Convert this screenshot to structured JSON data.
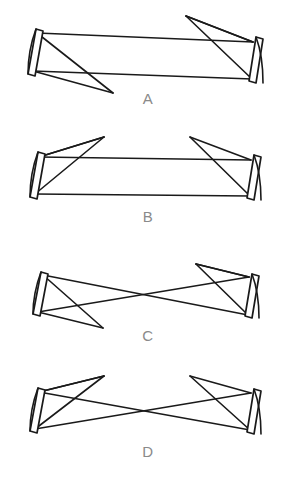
{
  "figure": {
    "background_color": "#ffffff",
    "line_color": "#1a1a1a",
    "label_color": "#8a8a8a",
    "width": 284,
    "height": 486,
    "panel_count": 4
  },
  "panels": [
    {
      "id": "panel-a",
      "label": "A",
      "label_x": 148,
      "label_y": 104,
      "description": "Asymmetric cavity, ray bundle exits low on the left and folds high on the right",
      "left_mirror": {
        "name": "left-mirror",
        "outer": "M 36 29 L 43 31 L 35 76 L 28 74 Z",
        "arc": "M 36 29 C 30 45 28 60 28 74",
        "top_x": 37,
        "top_y": 32,
        "bottom_x": 33,
        "bottom_y": 72
      },
      "right_mirror": {
        "name": "right-mirror",
        "outer": "M 256 37 L 263 39 L 256 83 L 249 81 Z",
        "arc": "M 256 37 C 262 53 263 69 263 83",
        "top_x": 253,
        "top_y": 41,
        "bottom_x": 252,
        "bottom_y": 79
      },
      "rays": [
        "M 37 33 L 253 42",
        "M 33 71 L 252 79",
        "M 37 33 L 113 93",
        "M 33 71 L 113 93",
        "M 253 42 L 186 16",
        "M 252 79 L 186 16",
        "M 186 16 L 253 42"
      ]
    },
    {
      "id": "panel-b",
      "label": "B",
      "label_x": 148,
      "label_y": 222,
      "description": "Symmetric cavity with ray bundles folding upward and outward at both mirrors",
      "left_mirror": {
        "name": "left-mirror",
        "outer": "M 38 152 L 45 154 L 37 199 L 30 197 Z",
        "arc": "M 38 152 C 32 168 30 183 30 197",
        "top_x": 39,
        "top_y": 155,
        "bottom_x": 35,
        "bottom_y": 195
      },
      "right_mirror": {
        "name": "right-mirror",
        "outer": "M 254 155 L 261 157 L 254 200 L 247 198 Z",
        "arc": "M 254 155 C 260 171 261 186 261 200",
        "top_x": 251,
        "top_y": 158,
        "bottom_x": 250,
        "bottom_y": 196
      },
      "rays": [
        "M 39 157 L 251 160",
        "M 35 194 L 250 196",
        "M 39 157 L 104 137",
        "M 35 194 L 104 137",
        "M 251 160 L 190 137",
        "M 250 196 L 190 137",
        "M 104 137 L 39 157"
      ]
    },
    {
      "id": "panel-c",
      "label": "C",
      "label_x": 148,
      "label_y": 341,
      "description": "Confocal cavity, rays cross at a beam waist in the centre of the resonator",
      "left_mirror": {
        "name": "left-mirror",
        "outer": "M 41 272 L 48 274 L 40 316 L 33 314 Z",
        "arc": "M 41 272 C 35 288 33 301 33 314",
        "top_x": 43,
        "top_y": 275,
        "bottom_x": 38,
        "bottom_y": 312
      },
      "right_mirror": {
        "name": "right-mirror",
        "outer": "M 252 274 L 259 276 L 252 318 L 245 316 Z",
        "arc": "M 252 274 C 258 290 259 304 259 318",
        "top_x": 249,
        "top_y": 277,
        "bottom_x": 248,
        "bottom_y": 315
      },
      "rays": [
        "M 43 275 L 248 315",
        "M 38 312 L 249 277",
        "M 43 275 L 103 328",
        "M 38 312 L 103 328",
        "M 249 277 L 196 264",
        "M 248 315 L 196 264",
        "M 196 264 L 249 277"
      ]
    },
    {
      "id": "panel-d",
      "label": "D",
      "label_x": 148,
      "label_y": 457,
      "description": "Symmetric confocal cavity with crossed rays and folded bundles at both mirrors",
      "left_mirror": {
        "name": "left-mirror",
        "outer": "M 38 388 L 45 390 L 37 433 L 30 431 Z",
        "arc": "M 38 388 C 32 404 30 418 30 431",
        "top_x": 39,
        "top_y": 392,
        "bottom_x": 35,
        "bottom_y": 429
      },
      "right_mirror": {
        "name": "right-mirror",
        "outer": "M 254 389 L 261 391 L 254 434 L 247 432 Z",
        "arc": "M 254 389 C 260 405 261 419 261 434",
        "top_x": 251,
        "top_y": 393,
        "bottom_x": 250,
        "bottom_y": 430
      },
      "rays": [
        "M 39 392 L 250 430",
        "M 35 429 L 251 393",
        "M 39 392 L 104 376",
        "M 35 429 L 104 376",
        "M 251 393 L 190 376",
        "M 250 430 L 190 376",
        "M 104 376 L 39 392"
      ]
    }
  ]
}
